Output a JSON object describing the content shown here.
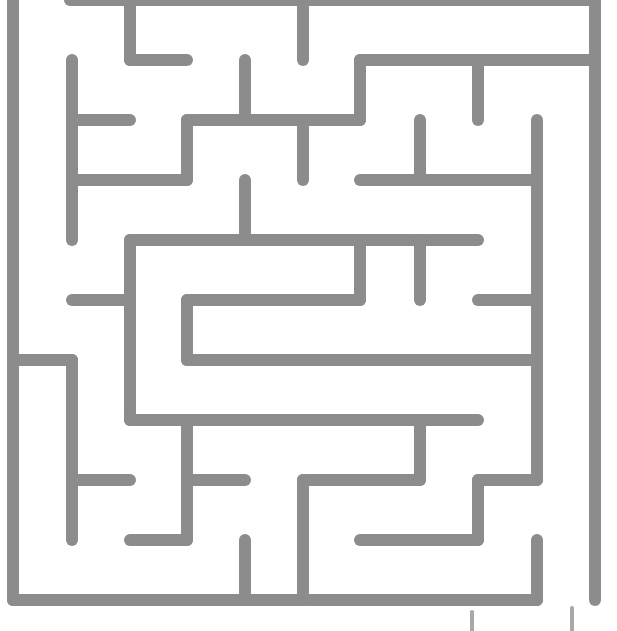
{
  "colors": {
    "wall": "#8c8c8c",
    "background": "#ffffff"
  },
  "wall_width": 12,
  "entrance": {
    "position": "top-left",
    "x": 40,
    "y": 0
  },
  "exit": {
    "position": "bottom-right",
    "x": 567,
    "y": 600
  },
  "walls": [
    [
      13,
      0,
      13,
      600
    ],
    [
      70,
      0,
      595,
      0
    ],
    [
      595,
      0,
      595,
      600
    ],
    [
      13,
      600,
      537,
      600
    ],
    [
      130,
      0,
      130,
      60
    ],
    [
      130,
      60,
      187,
      60
    ],
    [
      303,
      0,
      303,
      60
    ],
    [
      360,
      60,
      595,
      60
    ],
    [
      360,
      60,
      360,
      120
    ],
    [
      478,
      60,
      478,
      120
    ],
    [
      72,
      60,
      72,
      240
    ],
    [
      72,
      120,
      130,
      120
    ],
    [
      72,
      180,
      187,
      180
    ],
    [
      187,
      120,
      360,
      120
    ],
    [
      187,
      120,
      187,
      180
    ],
    [
      245,
      60,
      245,
      120
    ],
    [
      303,
      120,
      303,
      180
    ],
    [
      420,
      120,
      420,
      180
    ],
    [
      360,
      180,
      537,
      180
    ],
    [
      537,
      120,
      537,
      480
    ],
    [
      245,
      180,
      245,
      240
    ],
    [
      130,
      240,
      478,
      240
    ],
    [
      130,
      240,
      130,
      420
    ],
    [
      72,
      300,
      130,
      300
    ],
    [
      360,
      240,
      360,
      300
    ],
    [
      420,
      240,
      420,
      300
    ],
    [
      187,
      300,
      360,
      300
    ],
    [
      187,
      300,
      187,
      360
    ],
    [
      187,
      360,
      537,
      360
    ],
    [
      478,
      300,
      537,
      300
    ],
    [
      13,
      360,
      72,
      360
    ],
    [
      72,
      360,
      72,
      540
    ],
    [
      130,
      420,
      478,
      420
    ],
    [
      187,
      420,
      187,
      540
    ],
    [
      72,
      480,
      130,
      480
    ],
    [
      187,
      480,
      245,
      480
    ],
    [
      130,
      540,
      187,
      540
    ],
    [
      420,
      420,
      420,
      480
    ],
    [
      303,
      480,
      420,
      480
    ],
    [
      303,
      480,
      303,
      600
    ],
    [
      478,
      480,
      537,
      480
    ],
    [
      478,
      480,
      478,
      540
    ],
    [
      360,
      540,
      478,
      540
    ],
    [
      245,
      540,
      245,
      600
    ],
    [
      537,
      540,
      537,
      600
    ]
  ],
  "cut_marks": [
    [
      472,
      612,
      472,
      631
    ],
    [
      572,
      608,
      572,
      631
    ]
  ]
}
